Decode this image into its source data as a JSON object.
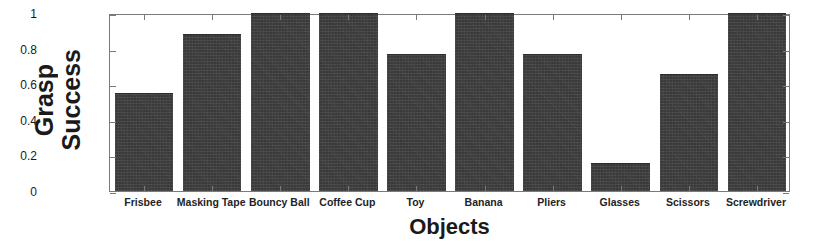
{
  "chart_data": {
    "type": "bar",
    "title": "",
    "xlabel": "Objects",
    "ylabel": "Grasp Success",
    "ylabel_lines": [
      "Grasp",
      "Success"
    ],
    "categories": [
      "Frisbee",
      "Masking Tape",
      "Bouncy Ball",
      "Coffee Cup",
      "Toy",
      "Banana",
      "Pliers",
      "Glasses",
      "Scissors",
      "Screwdriver"
    ],
    "values": [
      0.55,
      0.88,
      1.0,
      1.0,
      0.77,
      1.0,
      0.77,
      0.16,
      0.66,
      1.0
    ],
    "ylim": [
      0,
      1
    ],
    "yticks": [
      0,
      0.2,
      0.4,
      0.6,
      0.8,
      1
    ],
    "ytick_labels": [
      "0",
      "0.2",
      "0.4",
      "0.6",
      "0.8",
      "1"
    ],
    "grid": false,
    "legend": null,
    "bar_color": "#3f3f3f",
    "axis_color": "#7a7a7a",
    "background_color": "#ffffff"
  }
}
